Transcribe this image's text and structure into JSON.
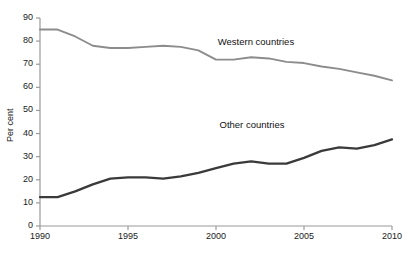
{
  "chart_data": {
    "type": "line",
    "title": "",
    "xlabel": "",
    "ylabel": "Per cent",
    "xlim": [
      1990,
      2010
    ],
    "ylim": [
      0,
      90
    ],
    "grid": false,
    "legend_position": "inline-annotation",
    "x": [
      1990,
      1991,
      1992,
      1993,
      1994,
      1995,
      1996,
      1997,
      1998,
      1999,
      2000,
      2001,
      2002,
      2003,
      2004,
      2005,
      2006,
      2007,
      2008,
      2009,
      2010
    ],
    "x_tick_labels": [
      "1990",
      "1995",
      "2000",
      "2005",
      "2010"
    ],
    "x_ticks": [
      1990,
      1995,
      2000,
      2005,
      2010
    ],
    "y_ticks": [
      0,
      10,
      20,
      30,
      40,
      50,
      60,
      70,
      80,
      90
    ],
    "y_tick_labels": [
      "0",
      "10",
      "20",
      "30",
      "40",
      "50",
      "60",
      "70",
      "80",
      "90"
    ],
    "series": [
      {
        "name": "Western countries",
        "color": "#8c8c8c",
        "label_x": 2000.1,
        "label_y": 79.5,
        "values": [
          85,
          85,
          82,
          78,
          77,
          77,
          77.5,
          78,
          77.5,
          76,
          72,
          72,
          73,
          72.5,
          71,
          70.5,
          69,
          68,
          66.5,
          65,
          63
        ]
      },
      {
        "name": "Other countries",
        "color": "#3a3a3a",
        "label_x": 2000.2,
        "label_y": 43.5,
        "values": [
          12.5,
          12.5,
          15,
          18,
          20.5,
          21,
          21,
          20.5,
          21.5,
          23,
          25,
          27,
          28,
          27,
          27,
          29.5,
          32.5,
          34,
          33.5,
          35,
          37.5
        ]
      }
    ]
  },
  "axis": {
    "y_axis_title": "Per cent"
  }
}
